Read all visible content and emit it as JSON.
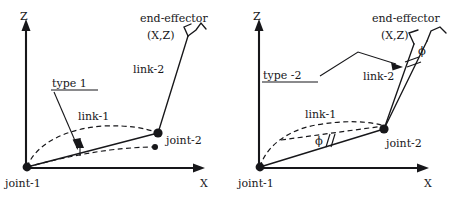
{
  "figure": {
    "background_color": "#ffffff",
    "ink_color": "#17171a"
  },
  "panels": [
    {
      "id": "type-1",
      "type_label": "type 1",
      "axes": {
        "vertical_label": "Z",
        "horizontal_label": "X"
      },
      "joints": {
        "base_label": "joint-1",
        "elbow_label": "joint-2"
      },
      "links": {
        "link1_label": "link-1",
        "link2_label": "link-2"
      },
      "end_effector": {
        "label": "end-effector",
        "coordinates_label": "(X,Z)"
      },
      "angle_labels": []
    },
    {
      "id": "type-2",
      "type_label": "type -2",
      "axes": {
        "vertical_label": "Z",
        "horizontal_label": "X"
      },
      "joints": {
        "base_label": "joint-1",
        "elbow_label": "joint-2"
      },
      "links": {
        "link1_label": "link-1",
        "link2_label": "link-2"
      },
      "end_effector": {
        "label": "end-effector",
        "coordinates_label": "(X,Z)"
      },
      "angle_labels": [
        "ϕ",
        "ϕ"
      ]
    }
  ]
}
